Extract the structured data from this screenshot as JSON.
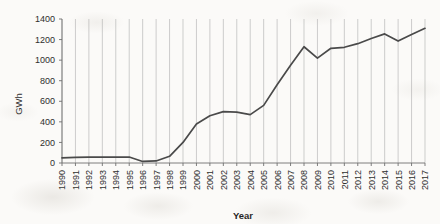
{
  "chart_data": {
    "type": "line",
    "title": "",
    "xlabel": "Year",
    "ylabel": "GWh",
    "grid": "vertical",
    "legend": "none",
    "xlim": [
      1990,
      2017
    ],
    "ylim": [
      0,
      1400
    ],
    "ytick_step": 200,
    "y_ticks": [
      "0",
      "200",
      "400",
      "600",
      "800",
      "1000",
      "1200",
      "1400"
    ],
    "categories": [
      "1990",
      "1991",
      "1992",
      "1993",
      "1994",
      "1995",
      "1996",
      "1997",
      "1998",
      "1999",
      "2000",
      "2001",
      "2002",
      "2003",
      "2004",
      "2005",
      "2006",
      "2007",
      "2008",
      "2009",
      "2010",
      "2011",
      "2012",
      "2013",
      "2014",
      "2015",
      "2016",
      "2017"
    ],
    "values": [
      50,
      55,
      58,
      58,
      58,
      58,
      15,
      20,
      65,
      200,
      380,
      460,
      500,
      495,
      470,
      560,
      760,
      950,
      1130,
      1020,
      1115,
      1125,
      1160,
      1210,
      1255,
      1185,
      1250,
      1310
    ],
    "series_name": "GWh"
  },
  "axes": {
    "y_label": "GWh",
    "x_label": "Year"
  }
}
